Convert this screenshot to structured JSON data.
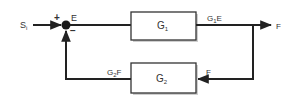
{
  "diagram": {
    "type": "feedback-control-block-diagram",
    "input": {
      "label": "S",
      "subscript": "i"
    },
    "summing_junction": {
      "plus_sign": "+",
      "minus_sign": "−",
      "output_label": "E"
    },
    "forward_block": {
      "label": "G",
      "subscript": "1"
    },
    "forward_output": {
      "label_prefix": "G",
      "subscript": "1",
      "label_suffix": "E"
    },
    "output": {
      "label": "F"
    },
    "feedback_block": {
      "label": "G",
      "subscript": "2"
    },
    "feedback_input": {
      "label": "F"
    },
    "feedback_output": {
      "label_prefix": "G",
      "subscript": "2",
      "label_suffix": "F"
    }
  }
}
